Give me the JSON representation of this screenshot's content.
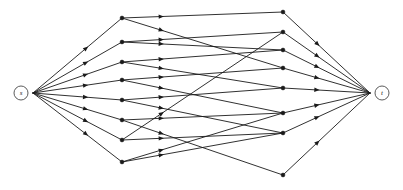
{
  "diagram": {
    "type": "directed-graph",
    "width": 403,
    "height": 190,
    "background_color": "#ffffff",
    "edge_color": "#1a1a1a",
    "node_color": "#1a1a1a",
    "terminal_stroke_color": "#4a4a4a",
    "terminal_fill_color": "#ffffff"
  },
  "terminals": [
    {
      "id": "s",
      "label": "s",
      "role": "source",
      "x": 21,
      "y": 93,
      "radius": 7
    },
    {
      "id": "t",
      "label": "t",
      "role": "sink",
      "x": 382,
      "y": 93,
      "radius": 7
    }
  ],
  "hub_points": [
    {
      "id": "s_hub",
      "x": 33,
      "y": 93
    },
    {
      "id": "t_hub",
      "x": 370,
      "y": 93
    }
  ],
  "layers": [
    {
      "name": "left-layer",
      "index": 1,
      "x": 122,
      "nodes": [
        {
          "id": "L1",
          "x": 122,
          "y": 18
        },
        {
          "id": "L2",
          "x": 122,
          "y": 42
        },
        {
          "id": "L3",
          "x": 122,
          "y": 62
        },
        {
          "id": "L4",
          "x": 122,
          "y": 80
        },
        {
          "id": "L5",
          "x": 122,
          "y": 100
        },
        {
          "id": "L6",
          "x": 122,
          "y": 120
        },
        {
          "id": "L7",
          "x": 122,
          "y": 140
        },
        {
          "id": "L8",
          "x": 122,
          "y": 162
        }
      ]
    },
    {
      "name": "right-layer",
      "index": 2,
      "x": 283,
      "nodes": [
        {
          "id": "R1",
          "x": 283,
          "y": 12
        },
        {
          "id": "R2",
          "x": 283,
          "y": 32
        },
        {
          "id": "R3",
          "x": 283,
          "y": 50
        },
        {
          "id": "R4",
          "x": 283,
          "y": 68
        },
        {
          "id": "R5",
          "x": 283,
          "y": 88
        },
        {
          "id": "R6",
          "x": 283,
          "y": 113
        },
        {
          "id": "R7",
          "x": 283,
          "y": 133
        },
        {
          "id": "R8",
          "x": 283,
          "y": 175
        }
      ]
    }
  ],
  "edges": {
    "source_fan": [
      {
        "from": "s_hub",
        "to": "L1"
      },
      {
        "from": "s_hub",
        "to": "L2"
      },
      {
        "from": "s_hub",
        "to": "L3"
      },
      {
        "from": "s_hub",
        "to": "L4"
      },
      {
        "from": "s_hub",
        "to": "L5"
      },
      {
        "from": "s_hub",
        "to": "L6"
      },
      {
        "from": "s_hub",
        "to": "L7"
      },
      {
        "from": "s_hub",
        "to": "L8"
      }
    ],
    "middle_cross": [
      {
        "from": "L1",
        "to": "R1"
      },
      {
        "from": "L1",
        "to": "R4"
      },
      {
        "from": "L2",
        "to": "R2"
      },
      {
        "from": "L2",
        "to": "R3"
      },
      {
        "from": "L3",
        "to": "R3"
      },
      {
        "from": "L3",
        "to": "R5"
      },
      {
        "from": "L4",
        "to": "R4"
      },
      {
        "from": "L4",
        "to": "R6"
      },
      {
        "from": "L5",
        "to": "R5"
      },
      {
        "from": "L5",
        "to": "R7"
      },
      {
        "from": "L6",
        "to": "R6"
      },
      {
        "from": "L6",
        "to": "R8"
      },
      {
        "from": "L7",
        "to": "R7"
      },
      {
        "from": "L7",
        "to": "R2"
      },
      {
        "from": "L8",
        "to": "R6"
      },
      {
        "from": "L8",
        "to": "R7"
      }
    ],
    "sink_fan": [
      {
        "from": "R1",
        "to": "t_hub"
      },
      {
        "from": "R2",
        "to": "t_hub"
      },
      {
        "from": "R3",
        "to": "t_hub"
      },
      {
        "from": "R4",
        "to": "t_hub"
      },
      {
        "from": "R5",
        "to": "t_hub"
      },
      {
        "from": "R6",
        "to": "t_hub"
      },
      {
        "from": "R7",
        "to": "t_hub"
      },
      {
        "from": "R8",
        "to": "t_hub"
      }
    ]
  },
  "style": {
    "node_radius": 1.9,
    "arrow_length": 5.2,
    "arrow_half_width": 2.2,
    "arrow_position_source_fan": 0.62,
    "arrow_position_middle": 0.26,
    "arrow_position_sink_fan": 0.42
  }
}
